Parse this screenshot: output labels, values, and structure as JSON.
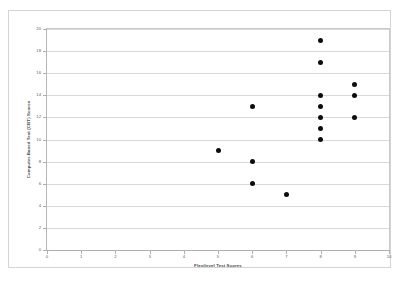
{
  "chart_data": {
    "type": "scatter",
    "title": "",
    "xlabel": "Flexilevel Test Scores",
    "ylabel": "Computer-Based Test (CBT) Scores",
    "xlim": [
      0,
      10
    ],
    "ylim": [
      0,
      20
    ],
    "x_ticks": [
      "0",
      "1",
      "2",
      "3",
      "4",
      "5",
      "6",
      "7",
      "8",
      "9",
      "10"
    ],
    "y_ticks": [
      "0",
      "2",
      "4",
      "6",
      "8",
      "10",
      "12",
      "14",
      "16",
      "18",
      "20"
    ],
    "grid": "horizontal",
    "legend": "none",
    "marker_color": "#0d0d0d",
    "marker_shape": "circle",
    "series": [
      {
        "name": "Test score pairs",
        "points": [
          {
            "x": 5,
            "y": 9
          },
          {
            "x": 6,
            "y": 13
          },
          {
            "x": 6,
            "y": 8
          },
          {
            "x": 6,
            "y": 6
          },
          {
            "x": 7,
            "y": 5
          },
          {
            "x": 8,
            "y": 19
          },
          {
            "x": 8,
            "y": 17
          },
          {
            "x": 8,
            "y": 14
          },
          {
            "x": 8,
            "y": 13
          },
          {
            "x": 8,
            "y": 12
          },
          {
            "x": 8,
            "y": 11
          },
          {
            "x": 8,
            "y": 10
          },
          {
            "x": 9,
            "y": 15
          },
          {
            "x": 9,
            "y": 14
          },
          {
            "x": 9,
            "y": 12
          }
        ]
      }
    ]
  },
  "colors": {
    "marker": "#0d0d0d",
    "gridline": "#d9d9d9",
    "axis": "#b0b0b0",
    "frame": "#d4d4d4",
    "tick_text": "#5e5e5e",
    "title_text": "#4a4a4a",
    "background": "#ffffff"
  }
}
